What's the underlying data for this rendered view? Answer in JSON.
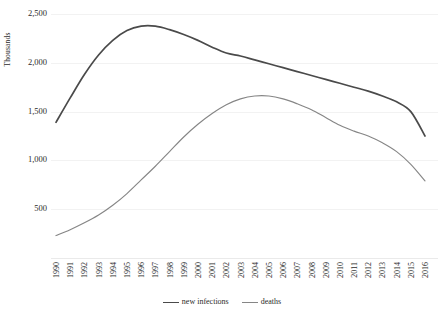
{
  "chart_data": {
    "type": "line",
    "title": "",
    "xlabel": "",
    "ylabel": "Thousands",
    "ylim": [
      0,
      2500
    ],
    "yticks": [
      500,
      1000,
      1500,
      2000,
      2500
    ],
    "ytick_labels": [
      "500",
      "1,000",
      "1,500",
      "2,000",
      "2,500"
    ],
    "grid": true,
    "legend_position": "bottom-center",
    "categories": [
      "1990",
      "1991",
      "1992",
      "1993",
      "1994",
      "1995",
      "1996",
      "1997",
      "1998",
      "1999",
      "2000",
      "2001",
      "2002",
      "2003",
      "2004",
      "2005",
      "2006",
      "2007",
      "2008",
      "2009",
      "2010",
      "2011",
      "2012",
      "2013",
      "2014",
      "2015",
      "2016"
    ],
    "series": [
      {
        "name": "new infections",
        "color": "#4a4a4a",
        "width": 1.7,
        "values": [
          1390,
          1640,
          1880,
          2080,
          2230,
          2330,
          2375,
          2375,
          2340,
          2290,
          2230,
          2160,
          2100,
          2070,
          2030,
          1990,
          1950,
          1910,
          1870,
          1830,
          1790,
          1750,
          1710,
          1660,
          1600,
          1500,
          1250
        ]
      },
      {
        "name": "deaths",
        "color": "#868686",
        "width": 1.15,
        "values": [
          230,
          290,
          360,
          440,
          540,
          660,
          800,
          940,
          1090,
          1240,
          1370,
          1480,
          1570,
          1630,
          1660,
          1660,
          1630,
          1580,
          1520,
          1440,
          1360,
          1300,
          1250,
          1180,
          1090,
          960,
          790
        ]
      }
    ]
  },
  "axis": {
    "y_title": "Thousands"
  },
  "legend": {
    "items": [
      {
        "label": "new infections"
      },
      {
        "label": "deaths"
      }
    ]
  }
}
